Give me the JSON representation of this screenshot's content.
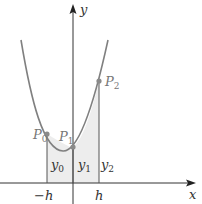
{
  "figure": {
    "type": "parabola-simpson-diagram",
    "axes": {
      "x_label": "x",
      "y_label": "y"
    },
    "points": [
      {
        "label": "P",
        "sub": "0"
      },
      {
        "label": "P",
        "sub": "1"
      },
      {
        "label": "P",
        "sub": "2"
      }
    ],
    "ordinates": [
      {
        "label": "y",
        "sub": "0"
      },
      {
        "label": "y",
        "sub": "1"
      },
      {
        "label": "y",
        "sub": "2"
      }
    ],
    "ticks": [
      {
        "label": "−h"
      },
      {
        "label": "h"
      }
    ],
    "colors": {
      "curve": "#808080",
      "shade": "#ededed",
      "axis": "#333333",
      "point": "#8a8a8a",
      "label": "#333333",
      "point_label": "#777777"
    }
  }
}
